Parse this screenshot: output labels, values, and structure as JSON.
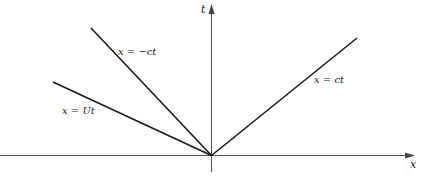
{
  "diagram": {
    "title": "",
    "axes": {
      "x_label": "x",
      "t_label": "t"
    },
    "lines": [
      {
        "id": "x-equals-ct",
        "label": "x = ct",
        "slope_desc": "right-going characteristic"
      },
      {
        "id": "x-equals-minus-ct",
        "label": "x = −ct",
        "slope_desc": "left-going characteristic"
      },
      {
        "id": "x-equals-Ut",
        "label": "x = Ut",
        "slope_desc": "moving source path"
      }
    ],
    "colors": {
      "line": "#1a1a1a",
      "axis": "#555555",
      "text": "#222222"
    }
  }
}
